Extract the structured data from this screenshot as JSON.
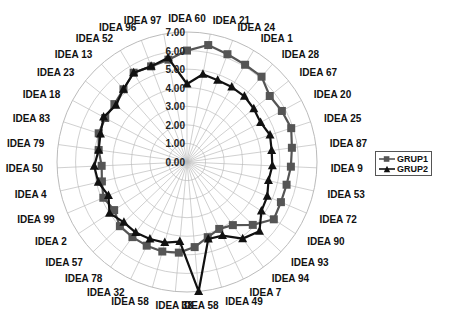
{
  "chart_data": {
    "type": "radar",
    "title": "",
    "categories": [
      "IDEA 60",
      "IDEA 21",
      "IDEA 24",
      "IDEA 1",
      "IDEA 28",
      "IDEA 67",
      "IDEA 20",
      "IDEA 25",
      "IDEA 87",
      "IDEA 9",
      "IDEA 53",
      "IDEA 72",
      "IDEA 90",
      "IDEA 93",
      "IDEA 94",
      "IDEA 7",
      "IDEA 49",
      "IDEA 58",
      "IDEA 38",
      "IDEA 58",
      "IDEA 32",
      "IDEA 78",
      "IDEA 57",
      "IDEA 2",
      "IDEA 99",
      "IDEA 4",
      "IDEA 50",
      "IDEA 79",
      "IDEA 83",
      "IDEA 18",
      "IDEA 23",
      "IDEA 13",
      "IDEA 52",
      "IDEA 96",
      "IDEA 97"
    ],
    "series": [
      {
        "name": "GRUP1",
        "marker": "square",
        "color": "#555555",
        "values": [
          6.0,
          6.4,
          6.2,
          6.1,
          6.1,
          5.7,
          5.8,
          5.9,
          5.7,
          5.6,
          5.5,
          5.5,
          5.6,
          4.9,
          4.2,
          4.0,
          4.2,
          4.6,
          4.9,
          5.0,
          5.0,
          5.0,
          5.0,
          4.7,
          4.9,
          4.7,
          4.6,
          4.8,
          5.0,
          5.0,
          5.0,
          5.2,
          5.6,
          5.5,
          5.6
        ]
      },
      {
        "name": "GRUP2",
        "marker": "triangle",
        "color": "#111111",
        "values": [
          4.2,
          4.8,
          4.7,
          4.7,
          4.7,
          4.6,
          4.5,
          4.7,
          4.6,
          4.6,
          4.5,
          4.7,
          4.8,
          5.4,
          5.1,
          4.4,
          4.3,
          7.0,
          4.3,
          4.5,
          4.6,
          4.7,
          4.7,
          5.0,
          4.6,
          4.9,
          5.0,
          4.8,
          4.9,
          5.1,
          4.9,
          5.2,
          5.6,
          5.5,
          5.7
        ]
      }
    ],
    "radial_ticks": [
      "0.00",
      "1.00",
      "2.00",
      "3.00",
      "4.00",
      "5.00",
      "6.00",
      "7.00"
    ],
    "rlim": [
      0,
      7
    ],
    "grid": true,
    "legend_position": "right"
  },
  "legend": {
    "items": [
      "GRUP1",
      "GRUP2"
    ]
  }
}
